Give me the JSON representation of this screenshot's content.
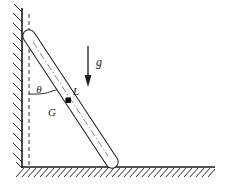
{
  "figure": {
    "width": 230,
    "height": 185,
    "background_color": "#ffffff",
    "line_color": "#1a1a1a"
  },
  "labels": {
    "angle": "θ",
    "gravity": "g",
    "length": "L",
    "center_of_mass": "G"
  },
  "label_positions": {
    "angle": {
      "x": 39,
      "y": 90
    },
    "gravity": {
      "x": 99,
      "y": 63
    },
    "length": {
      "x": 76,
      "y": 92
    },
    "center_of_mass": {
      "x": 52,
      "y": 113
    }
  },
  "font_sizes": {
    "angle": 11,
    "gravity": 12,
    "length": 11,
    "center_of_mass": 11
  },
  "geometry": {
    "wall": {
      "x": 22,
      "y_top": 8,
      "y_bottom": 168,
      "hatch_side": "left",
      "hatch_count": 16
    },
    "ground": {
      "y": 167,
      "x_left": 22,
      "x_right": 215,
      "hatch_side": "below",
      "hatch_count": 31
    },
    "rod": {
      "top_x": 29,
      "top_y": 36,
      "bottom_x": 112,
      "bottom_y": 162,
      "half_width": 6,
      "end_style": "rounded",
      "centerline_style": "dash-dot",
      "fill": "#ffffff"
    },
    "dashed_vertical": {
      "x": 29,
      "y_top": 14,
      "y_bottom": 167,
      "dash": "4,3"
    },
    "angle_arc": {
      "center_x": 29,
      "center_y": 36,
      "radius": 58,
      "from": "vertical-dashed",
      "to": "rod-axis"
    },
    "gravity_arrow": {
      "x": 88,
      "y_start": 46,
      "y_end": 86,
      "direction": "down"
    },
    "com_dot": {
      "x": 68,
      "y": 100,
      "size": 5,
      "shape": "square",
      "fill": "#000000"
    }
  }
}
